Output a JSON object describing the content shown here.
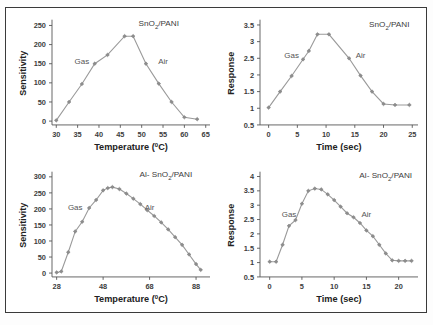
{
  "figure": {
    "background": "#ffffff",
    "border_color": "#3a3a3a",
    "line_color": "#9a9a9a",
    "marker_color": "#8d8d8d"
  },
  "panels": [
    {
      "id": "top-left",
      "series_label_main": "SnO",
      "series_label_sub": "2",
      "series_label_tail": "/PANI",
      "region_gas": "Gas",
      "region_air": "Air",
      "ylabel": "Sensitivity",
      "xlabel_main": "Temperature (",
      "xlabel_sup": "0",
      "xlabel_tail": "C)",
      "yticks": [
        "0",
        "50",
        "100",
        "150",
        "200",
        "250"
      ],
      "xticks": [
        "30",
        "35",
        "40",
        "45",
        "50",
        "55",
        "60",
        "65"
      ]
    },
    {
      "id": "top-right",
      "series_label_main": "SnO",
      "series_label_sub": "2",
      "series_label_tail": "/PANI",
      "region_gas": "Gas",
      "region_air": "Air",
      "ylabel": "Response",
      "xlabel_main": "Time (sec)",
      "xlabel_sup": "",
      "xlabel_tail": "",
      "yticks": [
        "0.5",
        "1",
        "1.5",
        "2",
        "2.5",
        "3",
        "3.5"
      ],
      "xticks": [
        "0",
        "5",
        "10",
        "15",
        "20",
        "25"
      ]
    },
    {
      "id": "bottom-left",
      "series_label_main": "Al- SnO",
      "series_label_sub": "2",
      "series_label_tail": "/PANI",
      "region_gas": "Gas",
      "region_air": "Air",
      "ylabel": "Sensitivity",
      "xlabel_main": "Temperature (",
      "xlabel_sup": "0",
      "xlabel_tail": "C)",
      "yticks": [
        "0",
        "50",
        "100",
        "150",
        "200",
        "250",
        "300"
      ],
      "xticks": [
        "28",
        "48",
        "68",
        "88"
      ]
    },
    {
      "id": "bottom-right",
      "series_label_main": "Al- SnO",
      "series_label_sub": "2",
      "series_label_tail": "/PANI",
      "region_gas": "Gas",
      "region_air": "Air",
      "ylabel": "Response",
      "xlabel_main": "Time (sec)",
      "xlabel_sup": "",
      "xlabel_tail": "",
      "yticks": [
        "0.5",
        "1",
        "1.5",
        "2",
        "2.5",
        "3",
        "3.5",
        "4"
      ],
      "xticks": [
        "0",
        "5",
        "10",
        "15",
        "20"
      ]
    }
  ],
  "chart_data": [
    {
      "type": "line",
      "id": "top-left",
      "title": "SnO2/PANI",
      "xlabel": "Temperature (0C)",
      "ylabel": "Sensitivity",
      "xlim": [
        29,
        66
      ],
      "ylim": [
        -10,
        260
      ],
      "xticks": [
        30,
        35,
        40,
        45,
        50,
        55,
        60,
        65
      ],
      "yticks": [
        0,
        50,
        100,
        150,
        200,
        250
      ],
      "grid": false,
      "legend": "none",
      "annotations": [
        {
          "text": "Gas",
          "x": 36,
          "y": 150
        },
        {
          "text": "Air",
          "x": 55,
          "y": 150
        },
        {
          "text": "SnO2/PANI",
          "x": 54,
          "y": 248
        }
      ],
      "x": [
        30,
        33,
        36,
        39,
        42,
        46,
        48,
        51,
        54,
        57,
        60,
        63
      ],
      "values": [
        2,
        50,
        97,
        150,
        173,
        222,
        222,
        150,
        98,
        50,
        10,
        5
      ]
    },
    {
      "type": "line",
      "id": "top-right",
      "title": "SnO2/PANI",
      "xlabel": "Time (sec)",
      "ylabel": "Response",
      "xlim": [
        -1.5,
        26
      ],
      "ylim": [
        0.5,
        3.6
      ],
      "xticks": [
        0,
        5,
        10,
        15,
        20,
        25
      ],
      "yticks": [
        0.5,
        1,
        1.5,
        2,
        2.5,
        3,
        3.5
      ],
      "grid": false,
      "legend": "none",
      "annotations": [
        {
          "text": "Gas",
          "x": 4,
          "y": 2.5
        },
        {
          "text": "Air",
          "x": 16,
          "y": 2.5
        },
        {
          "text": "SnO2/PANI",
          "x": 21,
          "y": 3.45
        }
      ],
      "x": [
        0,
        2,
        4,
        6,
        7,
        8.5,
        10.5,
        14,
        16,
        18,
        20,
        22,
        24.5
      ],
      "values": [
        1.02,
        1.5,
        1.97,
        2.47,
        2.72,
        3.22,
        3.22,
        2.5,
        1.98,
        1.5,
        1.13,
        1.1,
        1.1
      ]
    },
    {
      "type": "line",
      "id": "bottom-left",
      "title": "Al- SnO2/PANI",
      "xlabel": "Temperature (0C)",
      "ylabel": "Sensitivity",
      "xlim": [
        26,
        94
      ],
      "ylim": [
        -12,
        310
      ],
      "xticks": [
        28,
        48,
        68,
        88
      ],
      "yticks": [
        0,
        50,
        100,
        150,
        200,
        250,
        300
      ],
      "grid": false,
      "legend": "none",
      "annotations": [
        {
          "text": "Gas",
          "x": 36,
          "y": 196
        },
        {
          "text": "Air",
          "x": 68,
          "y": 196
        },
        {
          "text": "Al- SnO2/PANI",
          "x": 75,
          "y": 300
        }
      ],
      "x": [
        28,
        30,
        33,
        36,
        39,
        42,
        45,
        48,
        50,
        52,
        55,
        58,
        61,
        64,
        67,
        70,
        73,
        76,
        79,
        82,
        85,
        88,
        90
      ],
      "values": [
        2,
        5,
        65,
        130,
        160,
        203,
        228,
        258,
        265,
        268,
        262,
        248,
        232,
        215,
        196,
        178,
        158,
        136,
        112,
        88,
        58,
        28,
        10
      ]
    },
    {
      "type": "line",
      "id": "bottom-right",
      "title": "Al- SnO2/PANI",
      "xlabel": "Time (sec)",
      "ylabel": "Response",
      "xlim": [
        -1.5,
        23
      ],
      "ylim": [
        0.5,
        4.1
      ],
      "xticks": [
        0,
        5,
        10,
        15,
        20
      ],
      "yticks": [
        0.5,
        1,
        1.5,
        2,
        2.5,
        3,
        3.5,
        4
      ],
      "grid": false,
      "legend": "none",
      "annotations": [
        {
          "text": "Gas",
          "x": 3,
          "y": 2.6
        },
        {
          "text": "Air",
          "x": 15,
          "y": 2.6
        },
        {
          "text": "Al- SnO2/PANI",
          "x": 18,
          "y": 3.95
        }
      ],
      "x": [
        0,
        1,
        2,
        3,
        4,
        5,
        6,
        7,
        8,
        9,
        10,
        11,
        12,
        13,
        14,
        15,
        16,
        17,
        18,
        19,
        20,
        21,
        22
      ],
      "values": [
        1.03,
        1.03,
        1.62,
        2.28,
        2.48,
        3.05,
        3.5,
        3.58,
        3.55,
        3.38,
        3.18,
        2.95,
        2.72,
        2.58,
        2.38,
        2.12,
        1.92,
        1.62,
        1.32,
        1.08,
        1.06,
        1.06,
        1.06
      ]
    }
  ]
}
